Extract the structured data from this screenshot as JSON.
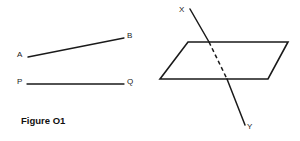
{
  "figure": {
    "caption": "Figure O1",
    "background_color": "#ffffff",
    "stroke_color": "#1a1a1a",
    "canvas": {
      "width": 300,
      "height": 141
    }
  },
  "left_panel": {
    "name": "two-line-segments",
    "segments": [
      {
        "id": "segment-ab",
        "start_label": "A",
        "end_label": "B",
        "style": "solid",
        "x1": 28,
        "y1": 57,
        "x2": 124,
        "y2": 38
      },
      {
        "id": "segment-pq",
        "start_label": "P",
        "end_label": "Q",
        "style": "solid",
        "x1": 27,
        "y1": 84,
        "x2": 124,
        "y2": 84
      }
    ],
    "labels": [
      {
        "id": "label-a",
        "text": "A"
      },
      {
        "id": "label-b",
        "text": "B"
      },
      {
        "id": "label-p",
        "text": "P"
      },
      {
        "id": "label-q",
        "text": "Q"
      }
    ]
  },
  "right_panel": {
    "name": "line-piercing-plane",
    "plane": {
      "id": "plane-parallelogram",
      "style": "solid",
      "points": "188,42 288,42 268,79 160,79"
    },
    "line": {
      "id": "line-xy",
      "start_label": "X",
      "end_label": "Y",
      "segments": [
        {
          "part": "above-plane",
          "style": "solid",
          "x1": 190,
          "y1": 9,
          "x2": 209,
          "y2": 42
        },
        {
          "part": "behind-plane",
          "style": "dashed",
          "x1": 209,
          "y1": 42,
          "x2": 227,
          "y2": 79
        },
        {
          "part": "below-plane",
          "style": "solid",
          "x1": 227,
          "y1": 79,
          "x2": 245,
          "y2": 125
        }
      ]
    },
    "labels": [
      {
        "id": "label-x",
        "text": "X"
      },
      {
        "id": "label-y",
        "text": "Y"
      }
    ]
  }
}
